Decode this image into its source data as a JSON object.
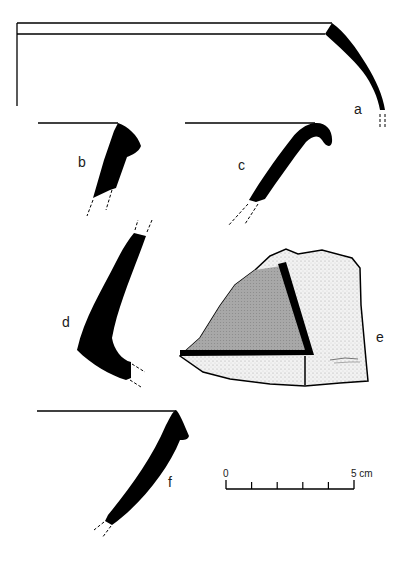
{
  "figure": {
    "type": "pottery profile drawings",
    "sherds": [
      {
        "id": "a",
        "label": "a"
      },
      {
        "id": "b",
        "label": "b"
      },
      {
        "id": "c",
        "label": "c"
      },
      {
        "id": "d",
        "label": "d"
      },
      {
        "id": "e",
        "label": "e"
      },
      {
        "id": "f",
        "label": "f"
      }
    ],
    "scale_bar": {
      "start_label": "0",
      "end_label": "5 cm",
      "ticks": 6
    },
    "colors": {
      "ink": "#000000",
      "grey_fill": "#9a9a9a",
      "stipple_fill": "#ececec",
      "background": "#ffffff"
    }
  }
}
